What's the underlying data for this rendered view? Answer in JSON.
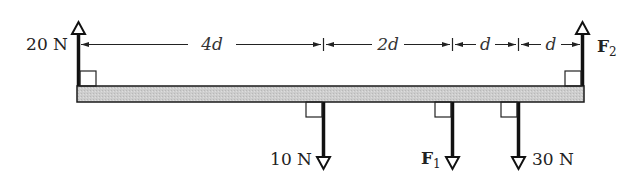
{
  "diagram": {
    "type": "beam-force-diagram",
    "beam": {
      "fill": "#c9c9c9",
      "stroke": "#1a1a1a"
    },
    "forces": [
      {
        "id": "left-up",
        "label": "20 N",
        "direction": "up",
        "position": "left end"
      },
      {
        "id": "right-up",
        "label": "F",
        "subscript": "2",
        "direction": "up",
        "position": "right end"
      },
      {
        "id": "down-10",
        "label": "10 N",
        "direction": "down",
        "position": "4d from left"
      },
      {
        "id": "down-f1",
        "label": "F",
        "subscript": "1",
        "direction": "down",
        "position": "6d from left"
      },
      {
        "id": "down-30",
        "label": "30 N",
        "direction": "down",
        "position": "7d from left"
      }
    ],
    "dimensions": [
      {
        "label": "4d"
      },
      {
        "label": "2d"
      },
      {
        "label": "d"
      },
      {
        "label": "d"
      }
    ]
  }
}
